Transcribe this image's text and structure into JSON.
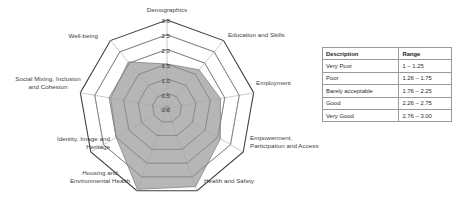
{
  "chart_data": {
    "type": "radar",
    "title": "",
    "axis_labels": [
      "Demographics",
      "Education and Skills",
      "Employment",
      "Empowerment,\nParticipation and Access",
      "Health and Safety",
      "Housing and\nEnvironmental Health",
      "Identity, Image and\nHeritage",
      "Social Mixing, Inclusion\nand Cohesion",
      "Well-being"
    ],
    "categories": [
      "Demographics",
      "Education and Skills",
      "Employment",
      "Empowerment, Participation and Access",
      "Health and Safety",
      "Housing and Environmental Health",
      "Identity, Image and Heritage",
      "Social Mixing, Inclusion and Cohesion",
      "Well-being"
    ],
    "values": [
      1.5,
      1.7,
      1.85,
      2.1,
      2.85,
      2.95,
      2.0,
      1.95,
      2.05
    ],
    "tick_labels": [
      "0.0",
      "0.5",
      "1.0",
      "1.5",
      "2.0",
      "2.5",
      "3.0"
    ],
    "tick_values": [
      0.0,
      0.5,
      1.0,
      1.5,
      2.0,
      2.5,
      3.0
    ],
    "rlim": [
      0,
      3
    ],
    "grid": true,
    "legend_position": "right",
    "series": [
      {
        "name": "Score",
        "values": [
          1.5,
          1.7,
          1.85,
          2.1,
          2.85,
          2.95,
          2.0,
          1.95,
          2.05
        ],
        "fill_color": "#a6a6a6",
        "line_color": "#8c8c8c"
      }
    ],
    "colors": {
      "fill": "#a6a6a6",
      "grid_line": "#7a7a7a",
      "outer_line": "#3f3f3f",
      "spoke": "#b4b4b4",
      "text": "#3d3d3d"
    }
  },
  "legend_table": {
    "name": "score-range-table",
    "headers": [
      "Description",
      "Range"
    ],
    "rows": [
      {
        "description": "Very Poor",
        "range": "1 – 1.25"
      },
      {
        "description": "Poor",
        "range": "1.26 – 1.75"
      },
      {
        "description": "Barely acceptable",
        "range": "1.76 – 2.25"
      },
      {
        "description": "Good",
        "range": "2.26 – 2.75"
      },
      {
        "description": "Very Good",
        "range": "2.76 – 3.00"
      }
    ]
  }
}
